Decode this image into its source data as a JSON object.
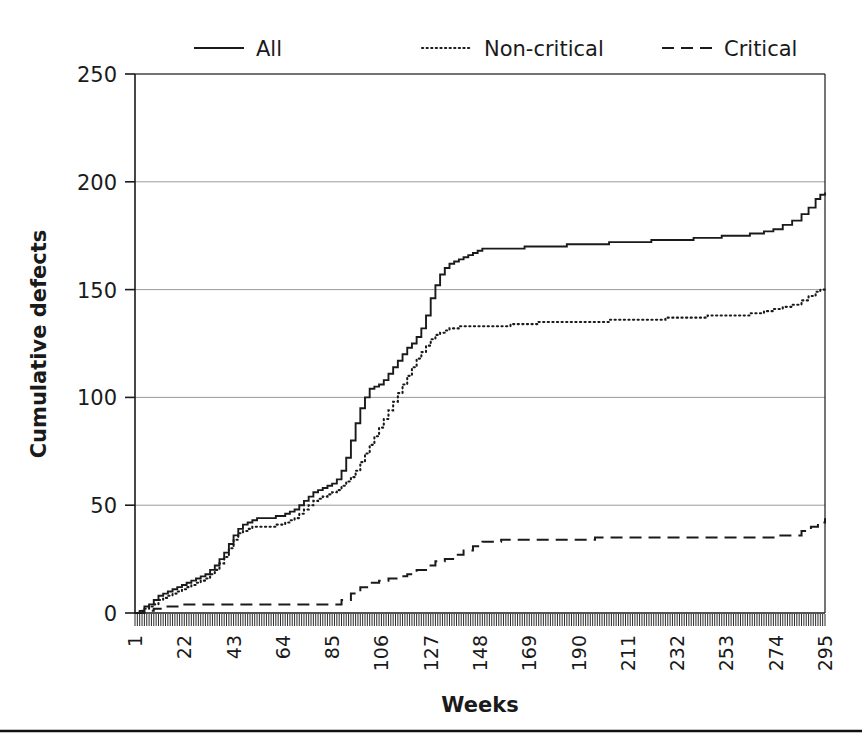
{
  "chart_data": {
    "type": "line",
    "title": "",
    "xlabel": "Weeks",
    "ylabel": "Cumulative defects",
    "xlim": [
      1,
      295
    ],
    "ylim": [
      0,
      250
    ],
    "grid": true,
    "legend_position": "top",
    "x_tick_labels": [
      "1",
      "22",
      "43",
      "64",
      "85",
      "106",
      "127",
      "148",
      "169",
      "190",
      "211",
      "232",
      "253",
      "274",
      "295"
    ],
    "x_tick_values": [
      1,
      22,
      43,
      64,
      85,
      106,
      127,
      148,
      169,
      190,
      211,
      232,
      253,
      274,
      295
    ],
    "y_tick_labels": [
      "0",
      "50",
      "100",
      "150",
      "200",
      "250"
    ],
    "y_tick_values": [
      0,
      50,
      100,
      150,
      200,
      250
    ],
    "series": [
      {
        "name": "All",
        "style": "solid",
        "x": [
          1,
          3,
          5,
          7,
          9,
          11,
          13,
          15,
          17,
          19,
          21,
          23,
          25,
          27,
          29,
          31,
          33,
          35,
          37,
          39,
          41,
          43,
          45,
          47,
          49,
          51,
          53,
          55,
          57,
          59,
          61,
          63,
          65,
          67,
          69,
          71,
          73,
          75,
          77,
          79,
          81,
          83,
          85,
          87,
          89,
          91,
          93,
          95,
          97,
          99,
          101,
          103,
          105,
          107,
          109,
          111,
          113,
          115,
          117,
          119,
          121,
          123,
          125,
          127,
          129,
          131,
          133,
          135,
          137,
          139,
          141,
          143,
          145,
          147,
          149,
          155,
          161,
          167,
          173,
          179,
          185,
          191,
          197,
          203,
          209,
          215,
          221,
          227,
          233,
          239,
          245,
          251,
          257,
          263,
          269,
          273,
          277,
          281,
          285,
          288,
          291,
          293,
          295
        ],
        "y": [
          0,
          1,
          3,
          4,
          6,
          8,
          9,
          10,
          11,
          12,
          13,
          14,
          15,
          16,
          17,
          18,
          20,
          22,
          25,
          28,
          32,
          36,
          39,
          41,
          42,
          43,
          44,
          44,
          44,
          44,
          45,
          45,
          46,
          47,
          48,
          50,
          52,
          54,
          56,
          57,
          58,
          59,
          60,
          62,
          66,
          72,
          80,
          88,
          95,
          100,
          104,
          105,
          106,
          108,
          111,
          114,
          117,
          120,
          123,
          125,
          128,
          132,
          138,
          146,
          152,
          157,
          160,
          162,
          163,
          164,
          165,
          166,
          167,
          168,
          169,
          169,
          169,
          170,
          170,
          170,
          171,
          171,
          171,
          172,
          172,
          172,
          173,
          173,
          173,
          174,
          174,
          175,
          175,
          176,
          177,
          178,
          180,
          182,
          185,
          188,
          192,
          194,
          195
        ],
        "final_value": 195
      },
      {
        "name": "Non-critical",
        "style": "dotted",
        "x": [
          1,
          3,
          5,
          7,
          9,
          11,
          13,
          15,
          17,
          19,
          21,
          23,
          25,
          27,
          29,
          31,
          33,
          35,
          37,
          39,
          41,
          43,
          45,
          47,
          49,
          51,
          53,
          55,
          57,
          59,
          61,
          63,
          65,
          67,
          69,
          71,
          73,
          75,
          77,
          79,
          81,
          83,
          85,
          87,
          89,
          91,
          93,
          95,
          97,
          99,
          101,
          103,
          105,
          107,
          109,
          111,
          113,
          115,
          117,
          119,
          121,
          123,
          125,
          127,
          129,
          131,
          133,
          135,
          137,
          139,
          141,
          143,
          145,
          147,
          149,
          155,
          161,
          167,
          173,
          179,
          185,
          191,
          197,
          203,
          209,
          215,
          221,
          227,
          233,
          239,
          245,
          251,
          257,
          263,
          269,
          273,
          277,
          281,
          285,
          288,
          291,
          293,
          295
        ],
        "y": [
          0,
          1,
          2,
          3,
          4,
          6,
          7,
          8,
          9,
          10,
          11,
          12,
          13,
          14,
          15,
          16,
          18,
          20,
          23,
          26,
          30,
          34,
          37,
          38,
          39,
          40,
          40,
          40,
          40,
          40,
          41,
          41,
          42,
          43,
          44,
          46,
          48,
          50,
          52,
          53,
          54,
          55,
          56,
          57,
          59,
          61,
          63,
          66,
          70,
          74,
          78,
          82,
          86,
          90,
          94,
          98,
          102,
          106,
          110,
          114,
          118,
          121,
          124,
          127,
          129,
          130,
          131,
          132,
          132,
          133,
          133,
          133,
          133,
          133,
          133,
          133,
          134,
          134,
          135,
          135,
          135,
          135,
          135,
          136,
          136,
          136,
          136,
          137,
          137,
          137,
          138,
          138,
          138,
          139,
          140,
          141,
          142,
          143,
          145,
          147,
          149,
          150,
          150
        ],
        "final_value": 150
      },
      {
        "name": "Critical",
        "style": "dashed",
        "x": [
          1,
          5,
          9,
          13,
          17,
          21,
          25,
          29,
          33,
          37,
          41,
          45,
          49,
          53,
          57,
          61,
          65,
          69,
          73,
          77,
          81,
          85,
          89,
          93,
          97,
          101,
          105,
          109,
          113,
          117,
          121,
          125,
          129,
          133,
          137,
          141,
          145,
          149,
          157,
          165,
          173,
          181,
          189,
          197,
          205,
          213,
          221,
          229,
          237,
          245,
          253,
          261,
          269,
          275,
          281,
          285,
          289,
          292,
          295
        ],
        "y": [
          0,
          1,
          2,
          3,
          3,
          4,
          4,
          4,
          4,
          4,
          4,
          4,
          4,
          4,
          4,
          4,
          4,
          4,
          4,
          4,
          4,
          4,
          6,
          9,
          12,
          14,
          15,
          16,
          17,
          18,
          20,
          22,
          24,
          25,
          27,
          29,
          31,
          33,
          34,
          34,
          34,
          34,
          34,
          35,
          35,
          35,
          35,
          35,
          35,
          35,
          35,
          35,
          35,
          36,
          36,
          38,
          40,
          42,
          44
        ],
        "final_value": 44
      }
    ]
  },
  "legend": {
    "items": [
      {
        "label": "All",
        "style": "solid"
      },
      {
        "label": "Non-critical",
        "style": "dotted"
      },
      {
        "label": "Critical",
        "style": "dashed"
      }
    ]
  },
  "axes": {
    "x_title": "Weeks",
    "y_title": "Cumulative defects"
  }
}
